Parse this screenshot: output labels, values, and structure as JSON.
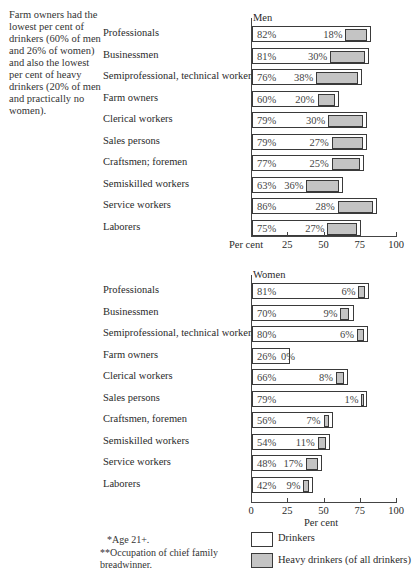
{
  "side_note": "Farm owners had the lowest per cent of drinkers (60% of men and 26% of women) and also the lowest per cent of heavy drinkers (20% of men and practically no women).",
  "footnotes": {
    "age": "*Age 21+.",
    "occupation": "**Occupation of chief family breadwinner."
  },
  "legend": {
    "drinkers": "Drinkers",
    "heavy": "Heavy drinkers (of all drinkers)"
  },
  "colors": {
    "drinker_fill": "#ffffff",
    "heavy_fill": "#c4c4c4",
    "border": "#3a3a3a"
  },
  "chart_data": [
    {
      "type": "bar",
      "orientation": "horizontal",
      "title": "Men",
      "xlabel": "Per cent",
      "xlim": [
        0,
        100
      ],
      "xticks": [
        "Per cent",
        "25",
        "50",
        "75",
        "100"
      ],
      "categories": [
        "Professionals",
        "Businessmen",
        "Semiprofessional, technical workers",
        "Farm owners",
        "Clerical workers",
        "Sales persons",
        "Craftsmen; foremen",
        "Semiskilled workers",
        "Service workers",
        "Laborers"
      ],
      "series": [
        {
          "name": "Drinkers",
          "values": [
            82,
            81,
            76,
            60,
            79,
            79,
            77,
            63,
            86,
            75
          ]
        },
        {
          "name": "Heavy drinkers (of all drinkers)",
          "values": [
            18,
            30,
            38,
            20,
            30,
            27,
            25,
            36,
            28,
            27
          ]
        }
      ],
      "grid": false
    },
    {
      "type": "bar",
      "orientation": "horizontal",
      "title": "Women",
      "xlabel": "Per cent",
      "xlim": [
        0,
        100
      ],
      "xticks": [
        "0",
        "25",
        "50",
        "75",
        "100"
      ],
      "categories": [
        "Professionals",
        "Businessmen",
        "Semiprofessional, technical workers",
        "Farm owners",
        "Clerical workers",
        "Sales persons",
        "Craftsmen, foremen",
        "Semiskilled workers",
        "Service workers",
        "Laborers"
      ],
      "series": [
        {
          "name": "Drinkers",
          "values": [
            81,
            70,
            80,
            26,
            66,
            79,
            56,
            54,
            48,
            42
          ]
        },
        {
          "name": "Heavy drinkers (of all drinkers)",
          "values": [
            6,
            9,
            6,
            0,
            8,
            1,
            7,
            11,
            17,
            9
          ]
        }
      ],
      "grid": false,
      "legend_position": "bottom"
    }
  ]
}
